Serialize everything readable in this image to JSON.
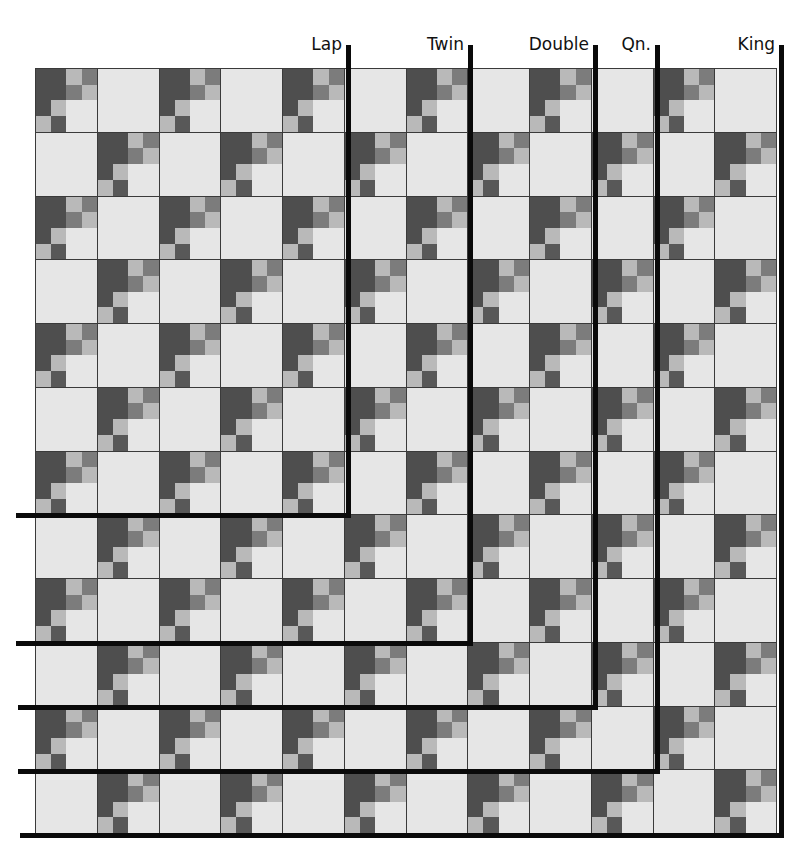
{
  "diagram": {
    "type": "quilt-size-chart",
    "grid": {
      "rows": 12,
      "cols": 12
    },
    "block_pattern": "checkerboard alternating pieced block and plain square; pieced when (row+col) even",
    "pieced_block_4x4": [
      [
        "dark",
        "dark",
        "light",
        "medium"
      ],
      [
        "dark",
        "dark",
        "medium",
        "light"
      ],
      [
        "dark",
        "light",
        "pale",
        "pale"
      ],
      [
        "light",
        "medium_dark",
        "pale",
        "pale"
      ]
    ],
    "colors": {
      "dark": "#4e4e4e",
      "medium_dark": "#585858",
      "medium": "#7c7c7c",
      "light": "#b9b9b9",
      "pale": "#e6e6e6",
      "plain_square": "#e6e6e6",
      "seam": "#3a3a3a",
      "size_line": "#0a0a0a"
    }
  },
  "sizes": [
    {
      "label": "Lap",
      "cols": 5,
      "rows": 7
    },
    {
      "label": "Twin",
      "cols": 7,
      "rows": 9
    },
    {
      "label": "Double",
      "cols": 9,
      "rows": 10
    },
    {
      "label": "Qn.",
      "cols": 10,
      "rows": 11
    },
    {
      "label": "King",
      "cols": 12,
      "rows": 12
    }
  ]
}
